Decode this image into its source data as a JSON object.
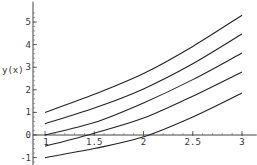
{
  "chart_data": {
    "type": "line",
    "title": "",
    "xlabel": "",
    "ylabel": "y(x)",
    "xlim": [
      0.83,
      3.15
    ],
    "ylim": [
      -1.35,
      5.9
    ],
    "x_ticks": [
      {
        "value": 1,
        "label": "1"
      },
      {
        "value": 1.5,
        "label": "1.5"
      },
      {
        "value": 2,
        "label": "2"
      },
      {
        "value": 2.5,
        "label": "2.5"
      },
      {
        "value": 3,
        "label": "3"
      }
    ],
    "y_ticks": [
      {
        "value": -1,
        "label": "-1"
      },
      {
        "value": 0,
        "label": "0"
      },
      {
        "value": 1,
        "label": "1"
      },
      {
        "value": 2,
        "label": "2"
      },
      {
        "value": 3,
        "label": "3"
      },
      {
        "value": 4,
        "label": "4"
      },
      {
        "value": 5,
        "label": "5"
      }
    ],
    "grid": false,
    "legend": "none",
    "x": [
      1,
      1.5,
      2,
      2.5,
      3
    ],
    "series": [
      {
        "name": "y(1)=1",
        "values": [
          1,
          1.8,
          2.72,
          3.92,
          5.3
        ]
      },
      {
        "name": "y(1)=0.5",
        "values": [
          0.5,
          1.19,
          2.04,
          3.15,
          4.47
        ]
      },
      {
        "name": "y(1)=0",
        "values": [
          0,
          0.55,
          1.42,
          2.45,
          3.63
        ]
      },
      {
        "name": "y(1)=-0.5",
        "values": [
          -0.5,
          0.08,
          0.75,
          1.72,
          2.79
        ]
      },
      {
        "name": "y(1)=-1",
        "values": [
          -1,
          -0.6,
          -0.08,
          0.8,
          1.86
        ]
      }
    ]
  }
}
